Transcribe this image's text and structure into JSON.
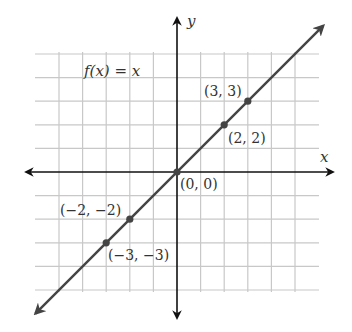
{
  "chart_data": {
    "type": "line",
    "title": "",
    "function_label": "f(x) = x",
    "xlabel": "x",
    "ylabel": "y",
    "xlim": [
      -5,
      5
    ],
    "ylim": [
      -5,
      5
    ],
    "grid": true,
    "series": [
      {
        "name": "f(x) = x",
        "x": [
          -6,
          6
        ],
        "y": [
          -6,
          6
        ]
      }
    ],
    "points": [
      {
        "x": 3,
        "y": 3,
        "label": "(3, 3)"
      },
      {
        "x": 2,
        "y": 2,
        "label": "(2, 2)"
      },
      {
        "x": 0,
        "y": 0,
        "label": "(0, 0)"
      },
      {
        "x": -2,
        "y": -2,
        "label": "(−2, −2)"
      },
      {
        "x": -3,
        "y": -3,
        "label": "(−3, −3)"
      }
    ]
  },
  "colors": {
    "grid": "#c8c8c8",
    "axis": "#111111",
    "line": "#444444",
    "point": "#444444",
    "text": "#333333"
  }
}
